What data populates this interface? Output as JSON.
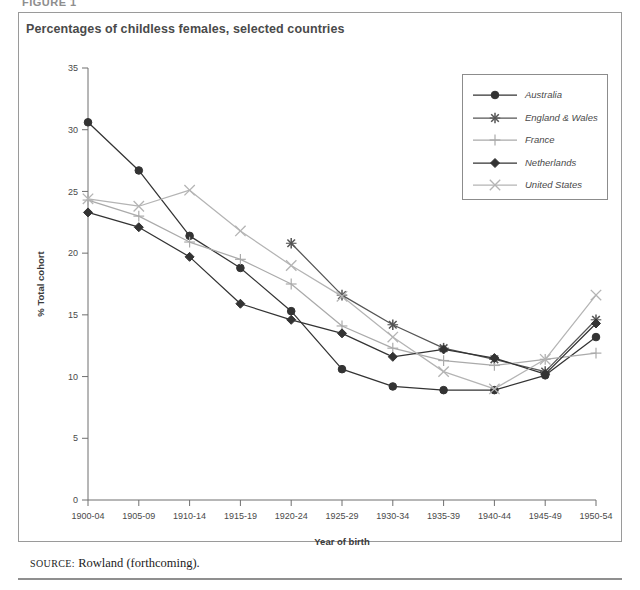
{
  "figure_label": "FIGURE 1",
  "chart_title": "Percentages of childless females, selected countries",
  "source": {
    "label": "source:",
    "text": "Rowland (forthcoming)."
  },
  "legend": {
    "position": "top-right-inside",
    "entries": [
      {
        "name": "Australia",
        "marker": "circle",
        "color": "#333333"
      },
      {
        "name": "England & Wales",
        "marker": "asterisk",
        "color": "#555555"
      },
      {
        "name": "France",
        "marker": "plus",
        "color": "#aaaaaa"
      },
      {
        "name": "Netherlands",
        "marker": "diamond",
        "color": "#333333"
      },
      {
        "name": "United States",
        "marker": "cross",
        "color": "#b4b4b4"
      }
    ]
  },
  "chart_data": {
    "type": "line",
    "title": "Percentages of childless females, selected countries",
    "xlabel": "Year of birth",
    "ylabel": "% Total cohort",
    "ylim": [
      0,
      35
    ],
    "yticks": [
      0,
      5,
      10,
      15,
      20,
      25,
      30,
      35
    ],
    "grid": false,
    "legend_position": "top-right-inside",
    "categories": [
      "1900-04",
      "1905-09",
      "1910-14",
      "1915-19",
      "1920-24",
      "1925-29",
      "1930-34",
      "1935-39",
      "1940-44",
      "1945-49",
      "1950-54"
    ],
    "series": [
      {
        "name": "Australia",
        "marker": "circle",
        "color": "#333333",
        "values": [
          30.6,
          26.7,
          21.4,
          18.8,
          15.3,
          10.6,
          9.2,
          8.9,
          8.9,
          10.1,
          13.2
        ]
      },
      {
        "name": "England & Wales",
        "marker": "asterisk",
        "color": "#555555",
        "values": [
          null,
          null,
          null,
          null,
          20.8,
          16.6,
          14.2,
          12.3,
          11.4,
          10.4,
          14.6
        ]
      },
      {
        "name": "France",
        "marker": "plus",
        "color": "#aaaaaa",
        "values": [
          24.3,
          23.0,
          20.9,
          19.5,
          17.5,
          14.1,
          12.3,
          11.3,
          10.9,
          11.4,
          11.9
        ]
      },
      {
        "name": "Netherlands",
        "marker": "diamond",
        "color": "#333333",
        "values": [
          23.3,
          22.1,
          19.7,
          15.9,
          14.6,
          13.5,
          11.6,
          12.2,
          11.5,
          10.2,
          14.3
        ]
      },
      {
        "name": "United States",
        "marker": "cross",
        "color": "#b4b4b4",
        "values": [
          24.4,
          23.8,
          25.1,
          21.8,
          19.0,
          16.5,
          13.2,
          10.4,
          9.0,
          11.4,
          16.6
        ]
      }
    ]
  }
}
